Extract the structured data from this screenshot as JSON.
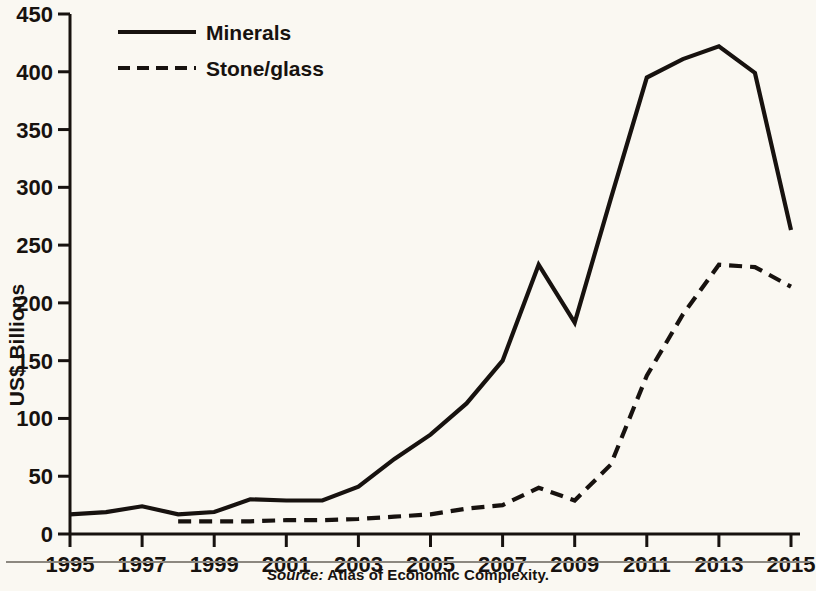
{
  "figure": {
    "background_color": "#faf8f2",
    "ink_color": "#17120f",
    "source_prefix": "Source:",
    "source_text": " Atlas of Economic Complexity."
  },
  "axes": {
    "y_title": "US$ Billions",
    "y_ticks": [
      "0",
      "50",
      "100",
      "150",
      "200",
      "250",
      "300",
      "350",
      "400",
      "450"
    ],
    "x_ticks": [
      "1995",
      "1997",
      "1999",
      "2001",
      "2003",
      "2005",
      "2007",
      "2009",
      "2011",
      "2013",
      "2015"
    ]
  },
  "legend": {
    "entries": [
      {
        "label": "Minerals",
        "style": "solid",
        "color": "#17120f"
      },
      {
        "label": "Stone/glass",
        "style": "dashed",
        "color": "#17120f"
      }
    ]
  },
  "chart_data": {
    "type": "line",
    "title": "",
    "subtitle": "",
    "xlabel": "",
    "ylabel": "US$ Billions",
    "xlim": [
      1995,
      2015
    ],
    "ylim": [
      0,
      450
    ],
    "grid": false,
    "legend_position": "top-left",
    "source": "Source: Atlas of Economic Complexity.",
    "x": [
      1995,
      1996,
      1997,
      1998,
      1999,
      2000,
      2001,
      2002,
      2003,
      2004,
      2005,
      2006,
      2007,
      2008,
      2009,
      2010,
      2011,
      2012,
      2013,
      2014,
      2015
    ],
    "series": [
      {
        "name": "Minerals",
        "style": "solid",
        "color": "#17120f",
        "x": [
          1995,
          1996,
          1997,
          1998,
          1999,
          2000,
          2001,
          2002,
          2003,
          2004,
          2005,
          2006,
          2007,
          2008,
          2009,
          2010,
          2011,
          2012,
          2013,
          2014,
          2015
        ],
        "values": [
          17,
          19,
          24,
          17,
          19,
          30,
          29,
          29,
          41,
          65,
          86,
          113,
          150,
          233,
          183,
          290,
          395,
          411,
          422,
          399,
          263
        ]
      },
      {
        "name": "Stone/glass",
        "style": "dashed",
        "color": "#17120f",
        "x": [
          1998,
          1999,
          2000,
          2001,
          2002,
          2003,
          2004,
          2005,
          2006,
          2007,
          2008,
          2009,
          2010,
          2011,
          2012,
          2013,
          2014,
          2015
        ],
        "values": [
          11,
          11,
          11,
          12,
          12,
          13,
          15,
          17,
          22,
          25,
          40,
          29,
          60,
          137,
          190,
          233,
          231,
          214
        ]
      }
    ]
  }
}
